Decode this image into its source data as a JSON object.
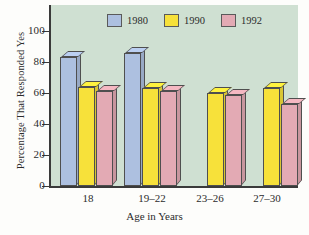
{
  "chart_data": {
    "type": "bar",
    "title": "",
    "xlabel": "Age in Years",
    "ylabel": "Percentage That Responded Yes",
    "categories": [
      "18",
      "19–22",
      "23–26",
      "27–30"
    ],
    "ylim": [
      0,
      100
    ],
    "yticks": [
      0,
      20,
      40,
      60,
      80,
      100
    ],
    "grid": false,
    "legend_position": "top-center",
    "style": "3d-bar",
    "series": [
      {
        "name": "1980",
        "color": "#adc0e0",
        "values": [
          83,
          86,
          null,
          null
        ]
      },
      {
        "name": "1990",
        "color": "#f7e13a",
        "values": [
          64,
          63,
          60,
          63
        ]
      },
      {
        "name": "1992",
        "color": "#e3aab4",
        "values": [
          61,
          61,
          59,
          53
        ]
      }
    ],
    "colors": {
      "plot_background": "#cfe0d2",
      "axis": "#3a3a3a",
      "bar_outline": "#4f4f4f",
      "series_1980": "#adc0e0",
      "series_1990": "#f7e13a",
      "series_1992": "#e3aab4"
    }
  },
  "legend": {
    "items": [
      {
        "label": "1980",
        "color": "#adc0e0"
      },
      {
        "label": "1990",
        "color": "#f7e13a"
      },
      {
        "label": "1992",
        "color": "#e3aab4"
      }
    ]
  },
  "axes": {
    "y_ticks": [
      "100",
      "80",
      "60",
      "40",
      "20",
      "0"
    ],
    "y_title": "Percentage That Responded Yes",
    "x_title": "Age in Years",
    "x_ticks": [
      "18",
      "19–22",
      "23–26",
      "27–30"
    ]
  }
}
